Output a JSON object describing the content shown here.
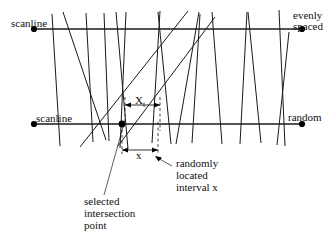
{
  "figure": {
    "background_color": "#ffffff",
    "line_color": "#1a1a1a",
    "labels": {
      "scanline_top": "scanline",
      "scanline_bottom": "scanline",
      "evenly_spaced_line1": "evenly",
      "evenly_spaced_line2": "spaced",
      "random": "random",
      "xt_symbol": "X",
      "xt_subscript": "t",
      "x_symbol": "x",
      "randomly_line1": "randomly",
      "randomly_line2": "located",
      "randomly_line3": "interval x",
      "selected_line1": "selected",
      "selected_line2": "intersection",
      "selected_line3": "point"
    },
    "geometry": {
      "scanline_top": {
        "x1": 34,
        "y1": 29,
        "x2": 302,
        "y2": 29
      },
      "scanline_bottom": {
        "x1": 34,
        "y1": 124,
        "x2": 302,
        "y2": 124
      },
      "intersection_point": {
        "x": 122,
        "y": 124
      },
      "interval_xt": {
        "left": 125,
        "right": 160,
        "y": 105
      },
      "interval_x": {
        "left": 122,
        "right": 158,
        "y": 150
      },
      "fibers": [
        {
          "x1": 60,
          "y1": 146,
          "x2": 52,
          "y2": 14
        },
        {
          "x1": 63,
          "y1": 12,
          "x2": 106,
          "y2": 140
        },
        {
          "x1": 86,
          "y1": 13,
          "x2": 93,
          "y2": 142
        },
        {
          "x1": 104,
          "y1": 13,
          "x2": 109,
          "y2": 141
        },
        {
          "x1": 116,
          "y1": 12,
          "x2": 128,
          "y2": 149
        },
        {
          "x1": 126,
          "y1": 12,
          "x2": 120,
          "y2": 148
        },
        {
          "x1": 80,
          "y1": 147,
          "x2": 188,
          "y2": 11
        },
        {
          "x1": 152,
          "y1": 143,
          "x2": 160,
          "y2": 11
        },
        {
          "x1": 158,
          "y1": 12,
          "x2": 171,
          "y2": 144
        },
        {
          "x1": 118,
          "y1": 146,
          "x2": 215,
          "y2": 17
        },
        {
          "x1": 176,
          "y1": 144,
          "x2": 199,
          "y2": 12
        },
        {
          "x1": 200,
          "y1": 14,
          "x2": 192,
          "y2": 143
        },
        {
          "x1": 212,
          "y1": 12,
          "x2": 222,
          "y2": 144
        },
        {
          "x1": 240,
          "y1": 144,
          "x2": 247,
          "y2": 12
        },
        {
          "x1": 248,
          "y1": 12,
          "x2": 261,
          "y2": 143
        },
        {
          "x1": 279,
          "y1": 10,
          "x2": 285,
          "y2": 146
        },
        {
          "x1": 289,
          "y1": 32,
          "x2": 277,
          "y2": 145
        }
      ]
    }
  }
}
